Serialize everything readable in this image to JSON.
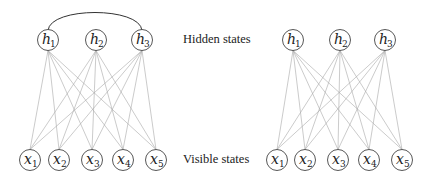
{
  "labels": {
    "hidden": "Hidden states",
    "visible": "Visible states"
  },
  "colors": {
    "edge": "#a8a8a8",
    "node_stroke": "#444444",
    "arc": "#333333",
    "text": "#222222"
  },
  "node_radius": 10.5,
  "graphs": [
    {
      "name": "left-graph",
      "description": "bipartite graph with connection among hidden units",
      "hidden": [
        {
          "var": "h",
          "sub": "1",
          "x": 48,
          "y": 40
        },
        {
          "var": "h",
          "sub": "2",
          "x": 96,
          "y": 40
        },
        {
          "var": "h",
          "sub": "3",
          "x": 142,
          "y": 40
        }
      ],
      "visible": [
        {
          "var": "x",
          "sub": "1",
          "x": 30,
          "y": 160
        },
        {
          "var": "x",
          "sub": "2",
          "x": 59,
          "y": 160
        },
        {
          "var": "x",
          "sub": "3",
          "x": 92,
          "y": 160
        },
        {
          "var": "x",
          "sub": "4",
          "x": 123,
          "y": 160
        },
        {
          "var": "x",
          "sub": "5",
          "x": 156,
          "y": 160
        }
      ],
      "hidden_arc": {
        "from": "h1",
        "to": "h3"
      }
    },
    {
      "name": "right-graph",
      "description": "restricted bipartite graph",
      "hidden": [
        {
          "var": "h",
          "sub": "1",
          "x": 293,
          "y": 40
        },
        {
          "var": "h",
          "sub": "2",
          "x": 340,
          "y": 40
        },
        {
          "var": "h",
          "sub": "3",
          "x": 385,
          "y": 40
        }
      ],
      "visible": [
        {
          "var": "x",
          "sub": "1",
          "x": 277,
          "y": 160
        },
        {
          "var": "x",
          "sub": "2",
          "x": 305,
          "y": 160
        },
        {
          "var": "x",
          "sub": "3",
          "x": 338,
          "y": 160
        },
        {
          "var": "x",
          "sub": "4",
          "x": 369,
          "y": 160
        },
        {
          "var": "x",
          "sub": "5",
          "x": 402,
          "y": 160
        }
      ],
      "hidden_arc": null
    }
  ]
}
